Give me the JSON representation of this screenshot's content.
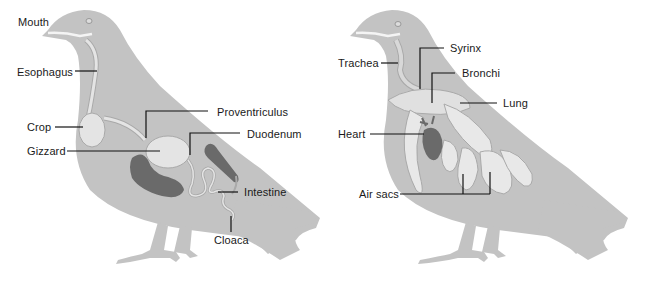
{
  "colors": {
    "body": "#c3c3c3",
    "organ_light": "#e4e4e4",
    "organ_outline": "#a9a9a9",
    "organ_dark": "#6a6a6a",
    "leader": "#111111",
    "text": "#1a1a1a"
  },
  "digestive_system": {
    "labels": {
      "mouth": "Mouth",
      "esophagus": "Esophagus",
      "crop": "Crop",
      "gizzard": "Gizzard",
      "proventriculus": "Proventriculus",
      "duodenum": "Duodenum",
      "intestine": "Intestine",
      "cloaca": "Cloaca"
    }
  },
  "respiratory_system": {
    "labels": {
      "trachea": "Trachea",
      "syrinx": "Syrinx",
      "bronchi": "Bronchi",
      "lung": "Lung",
      "heart": "Heart",
      "air_sacs": "Air sacs"
    }
  }
}
